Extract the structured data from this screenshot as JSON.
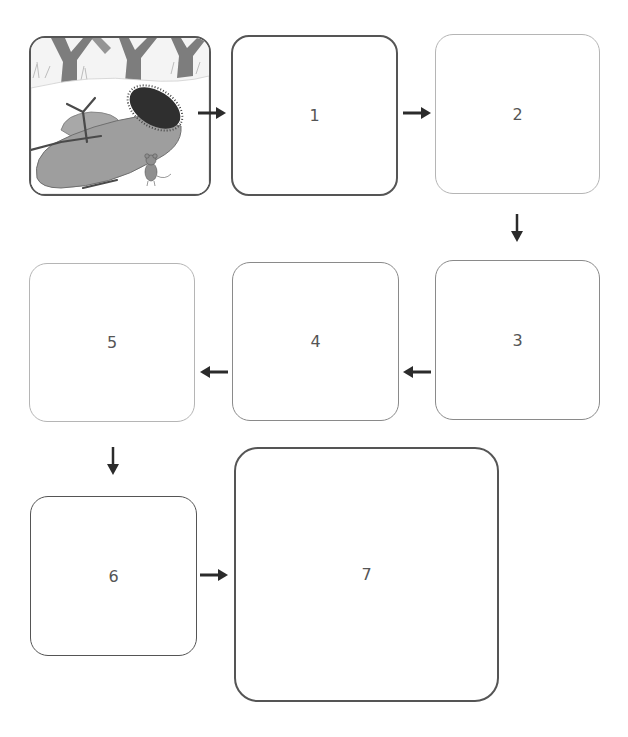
{
  "diagram": {
    "type": "sequence-flowchart",
    "start_image": {
      "label": "",
      "depicts": "pencil illustration of a mitten with fur cuff lying in snow, bare trees in background, a stick on the mitten and a small mouse standing beside it"
    },
    "boxes": [
      {
        "id": "box-1",
        "label": "1"
      },
      {
        "id": "box-2",
        "label": "2"
      },
      {
        "id": "box-3",
        "label": "3"
      },
      {
        "id": "box-4",
        "label": "4"
      },
      {
        "id": "box-5",
        "label": "5"
      },
      {
        "id": "box-6",
        "label": "6"
      },
      {
        "id": "box-7",
        "label": "7"
      }
    ],
    "arrows": [
      {
        "from": "start_image",
        "to": "box-1",
        "direction": "right"
      },
      {
        "from": "box-1",
        "to": "box-2",
        "direction": "right"
      },
      {
        "from": "box-2",
        "to": "box-3",
        "direction": "down"
      },
      {
        "from": "box-3",
        "to": "box-4",
        "direction": "left"
      },
      {
        "from": "box-4",
        "to": "box-5",
        "direction": "left"
      },
      {
        "from": "box-5",
        "to": "box-6",
        "direction": "down"
      },
      {
        "from": "box-6",
        "to": "box-7",
        "direction": "right"
      }
    ],
    "colors": {
      "arrow": "#2b2b2b",
      "border_dark": "#555555",
      "border_mid": "#8a8a8a",
      "border_light": "#b5b5b5",
      "label": "#555555"
    }
  }
}
